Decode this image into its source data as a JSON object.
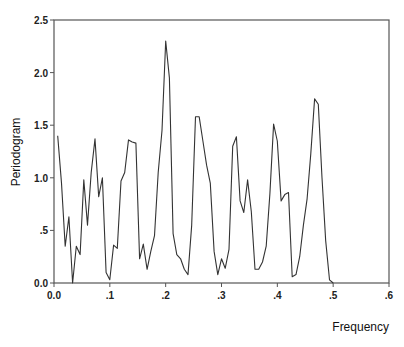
{
  "chart_data": {
    "type": "line",
    "title": "",
    "xlabel": "Frequency",
    "ylabel": "Periodogram",
    "xlim": [
      0.0,
      0.6
    ],
    "ylim": [
      0.0,
      2.5
    ],
    "xticks": [
      0.0,
      0.1,
      0.2,
      0.3,
      0.4,
      0.5,
      0.6
    ],
    "xtick_labels": [
      "0.0",
      ".1",
      ".2",
      ".3",
      ".4",
      ".5",
      ".6"
    ],
    "yticks": [
      0.0,
      0.5,
      1.0,
      1.5,
      2.0,
      2.5
    ],
    "ytick_labels": [
      "0.0",
      ".5",
      "1.0",
      "1.5",
      "2.0",
      "2.5"
    ],
    "grid": false,
    "legend": null,
    "line_color": "#333333",
    "series": [
      {
        "name": "Periodogram",
        "x": [
          0.0067,
          0.0134,
          0.02,
          0.0267,
          0.0334,
          0.04,
          0.0467,
          0.0534,
          0.06,
          0.0667,
          0.0734,
          0.08,
          0.0867,
          0.0934,
          0.1,
          0.1067,
          0.1134,
          0.12,
          0.1267,
          0.1334,
          0.14,
          0.1467,
          0.1534,
          0.16,
          0.1667,
          0.1734,
          0.18,
          0.1867,
          0.1934,
          0.2,
          0.2067,
          0.2134,
          0.22,
          0.2267,
          0.2334,
          0.24,
          0.2467,
          0.2534,
          0.26,
          0.2667,
          0.2734,
          0.28,
          0.2867,
          0.2934,
          0.3,
          0.3067,
          0.3134,
          0.32,
          0.3267,
          0.3334,
          0.34,
          0.3467,
          0.3534,
          0.36,
          0.3667,
          0.3734,
          0.38,
          0.3867,
          0.3934,
          0.4,
          0.4067,
          0.4134,
          0.42,
          0.4267,
          0.4334,
          0.44,
          0.4467,
          0.4534,
          0.46,
          0.4667,
          0.4734,
          0.48,
          0.4867,
          0.4934,
          0.5
        ],
        "values": [
          1.4,
          0.95,
          0.35,
          0.63,
          0.0,
          0.35,
          0.27,
          0.98,
          0.55,
          1.05,
          1.37,
          0.82,
          1.0,
          0.1,
          0.03,
          0.36,
          0.33,
          0.97,
          1.05,
          1.36,
          1.34,
          1.33,
          0.23,
          0.37,
          0.13,
          0.3,
          0.45,
          1.05,
          1.45,
          2.3,
          1.95,
          0.47,
          0.27,
          0.23,
          0.13,
          0.08,
          0.55,
          1.58,
          1.58,
          1.35,
          1.12,
          0.95,
          0.3,
          0.08,
          0.23,
          0.14,
          0.32,
          1.3,
          1.39,
          0.78,
          0.67,
          0.98,
          0.68,
          0.13,
          0.13,
          0.2,
          0.35,
          0.85,
          1.51,
          1.35,
          0.78,
          0.84,
          0.86,
          0.06,
          0.08,
          0.25,
          0.55,
          0.8,
          1.23,
          1.75,
          1.7,
          1.0,
          0.4,
          0.03,
          0.0
        ]
      }
    ]
  }
}
